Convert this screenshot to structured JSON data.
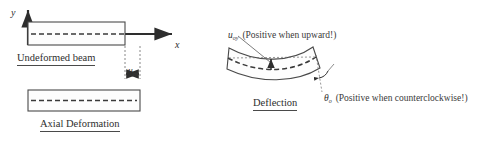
{
  "figure": {
    "background_color": "#ffffff",
    "line_color": "#3a3a3a",
    "dash_color": "#4a4a4a",
    "axes": {
      "y_label": "y",
      "x_label": "x"
    },
    "panels": {
      "undeformed": {
        "caption": "Undeformed beam"
      },
      "axial": {
        "caption": "Axial Deformation",
        "displacement_symbol": "u",
        "displacement_subscript": "ox"
      },
      "deflection": {
        "caption": "Deflection",
        "deflection_symbol": "u",
        "deflection_subscript": "oy",
        "deflection_note": "(Positive when upward!)",
        "rotation_symbol": "θ",
        "rotation_subscript": "o",
        "rotation_note": "(Positive when counterclockwise!)"
      }
    }
  }
}
